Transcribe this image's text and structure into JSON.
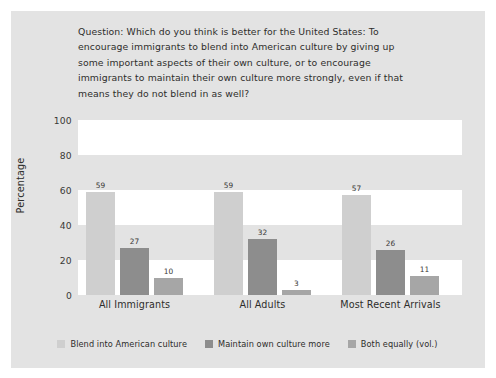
{
  "figure": {
    "question_prefix": "Question:",
    "question": "Question: Which do you think is better for the United States: To encourage immigrants to blend into American culture by giving up some important aspects of their own culture, or to encourage immigrants to maintain their own culture more strongly, even if that means they do not blend in as well?"
  },
  "colors": {
    "card_background": "#e3e3e3",
    "plot_band_white": "#ffffff",
    "plot_band_gray": "#e3e3e3",
    "series_1": "#cfcfcf",
    "series_2": "#8d8d8d",
    "series_3": "#a6a6a6",
    "text": "#2e2d2b"
  },
  "chart_data": {
    "type": "bar",
    "title": "",
    "subtitle": "",
    "xlabel": "",
    "ylabel": "Percentage",
    "ylim": [
      0,
      100
    ],
    "yticks": [
      0,
      20,
      40,
      60,
      80,
      100
    ],
    "ytick_labels": [
      "0",
      "20",
      "40",
      "60",
      "80",
      "100"
    ],
    "grid": false,
    "banded_background": true,
    "legend_position": "bottom",
    "categories": [
      "All Immigrants",
      "All Adults",
      "Most Recent Arrivals"
    ],
    "series": [
      {
        "name": "Blend into American culture",
        "color": "#cfcfcf",
        "values": [
          59,
          59,
          57
        ]
      },
      {
        "name": "Maintain own culture more",
        "color": "#8d8d8d",
        "values": [
          27,
          32,
          26
        ]
      },
      {
        "name": "Both equally (vol.)",
        "color": "#a6a6a6",
        "values": [
          10,
          3,
          11
        ]
      }
    ]
  }
}
